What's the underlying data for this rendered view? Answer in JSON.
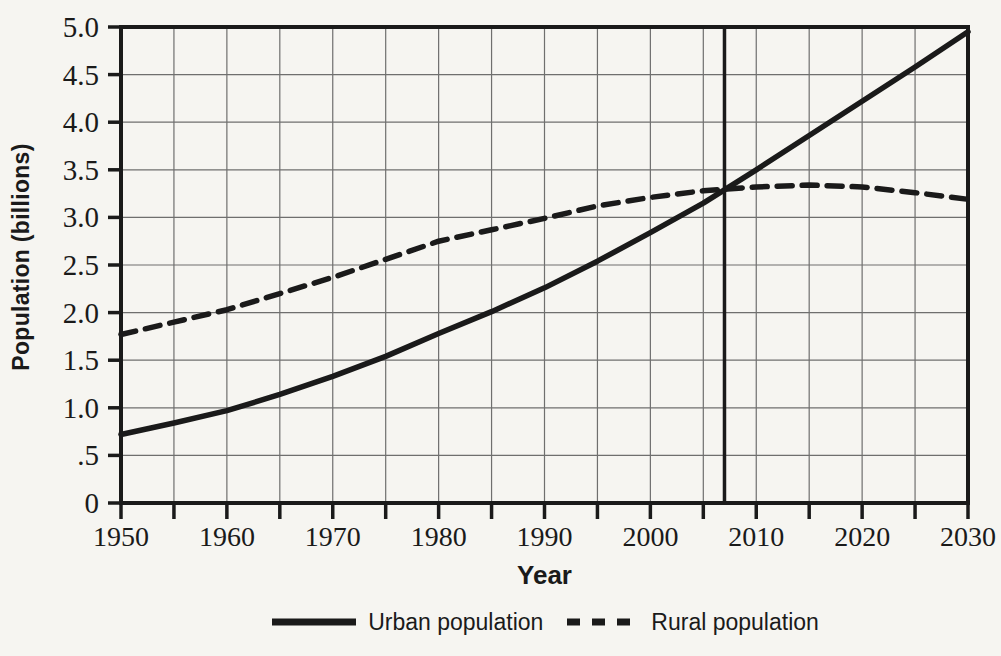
{
  "figure": {
    "background": "#f6f5f1",
    "ink": "#1a1a1a",
    "grid_color": "#585858"
  },
  "chart_data": {
    "type": "line",
    "title": "",
    "xlabel": "Year",
    "ylabel": "Population (billions)",
    "xlim": [
      1950,
      2030
    ],
    "ylim": [
      0,
      5
    ],
    "x_major_ticks": [
      1950,
      1960,
      1970,
      1980,
      1990,
      2000,
      2010,
      2020,
      2030
    ],
    "x_tick_labels": [
      "1950",
      "1960",
      "1970",
      "1980",
      "1990",
      "2000",
      "2010",
      "2020",
      "2030"
    ],
    "x_minor_tick_step": 5,
    "y_tick_step": 0.5,
    "y_tick_labels": [
      "0",
      ".5",
      "1.0",
      "1.5",
      "2.0",
      "2.5",
      "3.0",
      "3.5",
      "4.0",
      "4.5",
      "5.0"
    ],
    "grid": true,
    "legend_position": "bottom",
    "x": [
      1950,
      1955,
      1960,
      1965,
      1970,
      1975,
      1980,
      1985,
      1990,
      1995,
      2000,
      2005,
      2010,
      2015,
      2020,
      2025,
      2030
    ],
    "series": [
      {
        "name": "Urban population",
        "line_style": "solid",
        "values": [
          0.72,
          0.84,
          0.97,
          1.14,
          1.33,
          1.54,
          1.78,
          2.01,
          2.26,
          2.54,
          2.84,
          3.15,
          3.5,
          3.86,
          4.22,
          4.58,
          4.95
        ]
      },
      {
        "name": "Rural population",
        "line_style": "dashed",
        "values": [
          1.77,
          1.9,
          2.03,
          2.2,
          2.37,
          2.56,
          2.75,
          2.87,
          2.99,
          3.12,
          3.21,
          3.28,
          3.32,
          3.34,
          3.32,
          3.26,
          3.19
        ]
      }
    ],
    "marker_line_x": 2007,
    "crossover_note": "urban overtakes rural at about 2007 at 3.3 billion"
  }
}
